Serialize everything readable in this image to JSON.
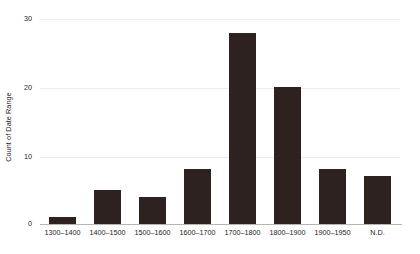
{
  "chart_data": {
    "type": "bar",
    "title": "",
    "subtitle": "",
    "xlabel": "",
    "ylabel": "Count of Date Range",
    "categories": [
      "1300–1400",
      "1400–1500",
      "1500–1600",
      "1600–1700",
      "1700–1800",
      "1800–1900",
      "1900–1950",
      "N.D."
    ],
    "values": [
      1,
      5,
      4,
      8,
      28,
      20,
      8,
      7
    ],
    "ylim": [
      0,
      30
    ],
    "yticks": [
      0,
      10,
      20,
      30
    ],
    "ytick_labels": [
      "0",
      "10",
      "20",
      "30"
    ],
    "grid": true,
    "grid_axis": "y",
    "legend": false,
    "legend_position": "none",
    "bar_color": "#2e2220",
    "grid_color": "#ececec",
    "axis_color": "#b9b4ad",
    "text_color": "#1c1c1c",
    "background_color": "#ffffff"
  }
}
